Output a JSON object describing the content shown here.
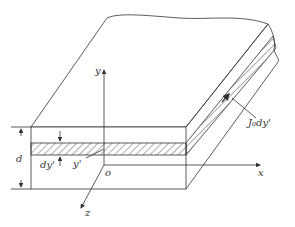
{
  "figure": {
    "labels": {
      "y_axis": "y",
      "x_axis": "x",
      "z_axis": "z",
      "origin": "o",
      "thickness": "d",
      "layer_thickness": "dy'",
      "layer_position": "y'",
      "current_element": "J₀dy'"
    },
    "colors": {
      "line": "#333333",
      "background": "#ffffff"
    }
  }
}
